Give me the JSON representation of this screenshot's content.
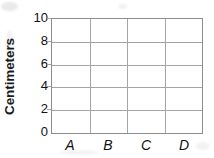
{
  "chart_data": {
    "type": "bar",
    "title": "",
    "subtitle": "",
    "xlabel": "",
    "ylabel": "Centimeters",
    "categories": [
      "A",
      "B",
      "C",
      "D"
    ],
    "values": [
      0,
      0,
      0,
      0
    ],
    "series": [
      {
        "name": "",
        "values": [
          0,
          0,
          0,
          0
        ]
      }
    ],
    "ylim": [
      0,
      10
    ],
    "y_ticks": [
      10,
      8,
      6,
      4,
      2,
      0
    ],
    "y_tick_step": 2,
    "x_ticks": [
      "A",
      "B",
      "C",
      "D"
    ],
    "grid": true,
    "grid_horizontal": true,
    "grid_vertical": true,
    "legend": false,
    "legend_position": "none",
    "annotations": [],
    "note": "Empty grid template: axes and gridlines drawn, no bars plotted",
    "colors": {
      "background": "#ffffff",
      "grid": "#a5a5a5",
      "axis": "#8d8d8d",
      "text": "#111111",
      "axis_title": "#1a1a1a"
    }
  }
}
